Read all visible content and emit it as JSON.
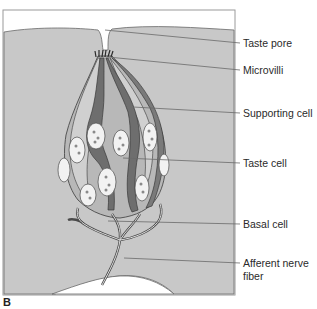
{
  "figure": {
    "panel_label": "B",
    "labels": [
      {
        "id": "taste-pore",
        "text": "Taste pore"
      },
      {
        "id": "microvilli",
        "text": "Microvilli"
      },
      {
        "id": "supporting-cell",
        "text": "Supporting cell"
      },
      {
        "id": "taste-cell",
        "text": "Taste cell"
      },
      {
        "id": "basal-cell",
        "text": "Basal cell"
      },
      {
        "id": "afferent-nerve-fiber",
        "text": "Afferent nerve",
        "text2": "fiber"
      }
    ]
  },
  "colors": {
    "background": "#ffffff",
    "epithelium": "#c8c8c8",
    "supporting_cell": "#b4b4b4",
    "taste_cell_dark": "#6e6e6e",
    "nucleus": "#f2f2f2",
    "outline": "#4a4a4a",
    "leader": "#6a6a6a"
  }
}
